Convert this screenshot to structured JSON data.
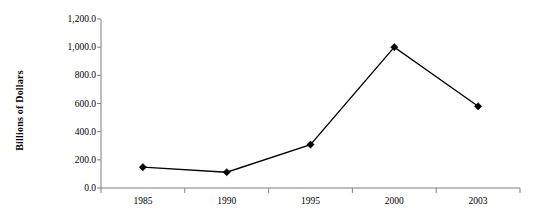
{
  "chart_data": {
    "type": "line",
    "title": "",
    "subtitle": "",
    "xlabel": "",
    "ylabel": "Billions of Dollars",
    "categories": [
      "1985",
      "1990",
      "1995",
      "2000",
      "2003"
    ],
    "x": [
      "1985",
      "1990",
      "1995",
      "2000",
      "2003"
    ],
    "values": [
      148.0,
      112.0,
      308.0,
      1000.0,
      580.0
    ],
    "series": [
      {
        "name": "Billions of Dollars",
        "values": [
          148.0,
          112.0,
          308.0,
          1000.0,
          580.0
        ]
      }
    ],
    "ylim": [
      0.0,
      1200.0
    ],
    "ytick_values": [
      0.0,
      200.0,
      400.0,
      600.0,
      800.0,
      1000.0,
      1200.0
    ],
    "ytick_labels": [
      "0.0",
      "200.0",
      "400.0",
      "600.0",
      "800.0",
      "1,000.0",
      "1,200.0"
    ],
    "xtick_labels": [
      "1985",
      "1990",
      "1995",
      "2000",
      "2003"
    ],
    "grid": false,
    "legend": false,
    "legend_position": "none",
    "marker": "diamond",
    "line_color": "#000000",
    "marker_color": "#000000",
    "axis_color": "#808080",
    "background_color": "#ffffff",
    "annotations": []
  },
  "colors": {
    "line": "#000000",
    "marker": "#000000",
    "axis": "#7f7f7f",
    "text": "#000000",
    "background": "#ffffff"
  }
}
